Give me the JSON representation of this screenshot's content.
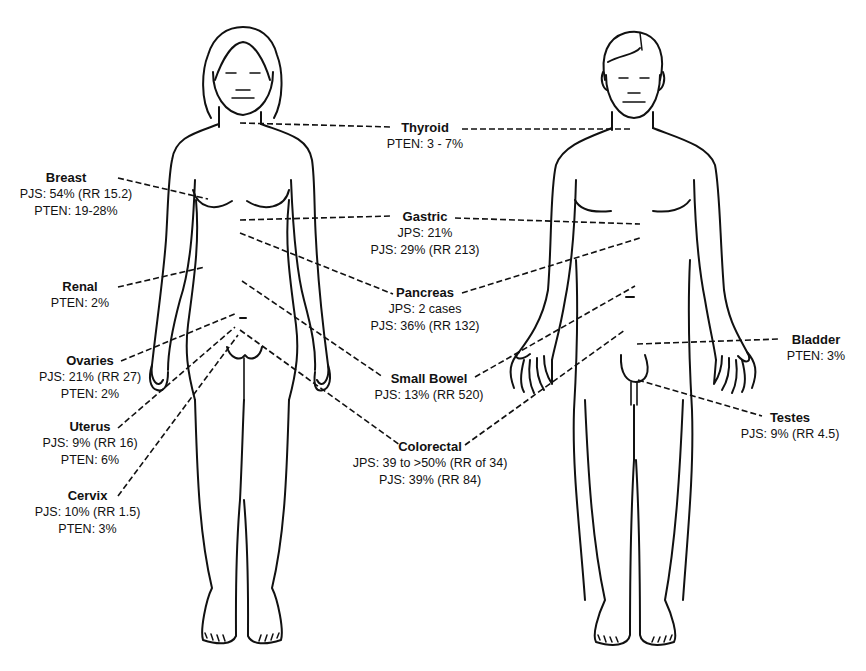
{
  "figure": {
    "type": "anatomical cancer-risk diagram",
    "figures": [
      "female-body",
      "male-body"
    ]
  },
  "organs": [
    {
      "id": "thyroid",
      "name": "Thyroid",
      "stats": [
        "PTEN: 3 - 7%"
      ]
    },
    {
      "id": "breast",
      "name": "Breast",
      "stats": [
        "PJS: 54% (RR 15.2)",
        "PTEN: 19-28%"
      ]
    },
    {
      "id": "gastric",
      "name": "Gastric",
      "stats": [
        "JPS: 21%",
        "PJS: 29% (RR 213)"
      ]
    },
    {
      "id": "renal",
      "name": "Renal",
      "stats": [
        "PTEN: 2%"
      ]
    },
    {
      "id": "pancreas",
      "name": "Pancreas",
      "stats": [
        "JPS: 2 cases",
        "PJS: 36% (RR 132)"
      ]
    },
    {
      "id": "ovaries",
      "name": "Ovaries",
      "stats": [
        "PJS: 21% (RR 27)",
        "PTEN: 2%"
      ]
    },
    {
      "id": "small_bowel",
      "name": "Small Bowel",
      "stats": [
        "PJS: 13% (RR 520)"
      ]
    },
    {
      "id": "bladder",
      "name": "Bladder",
      "stats": [
        "PTEN: 3%"
      ]
    },
    {
      "id": "uterus",
      "name": "Uterus",
      "stats": [
        "PJS: 9% (RR 16)",
        "PTEN: 6%"
      ]
    },
    {
      "id": "testes",
      "name": "Testes",
      "stats": [
        "PJS: 9% (RR 4.5)"
      ]
    },
    {
      "id": "colorectal",
      "name": "Colorectal",
      "stats": [
        "JPS: 39 to >50% (RR of 34)",
        "PJS: 39% (RR 84)"
      ]
    },
    {
      "id": "cervix",
      "name": "Cervix",
      "stats": [
        "PJS: 10% (RR 1.5)",
        "PTEN: 3%"
      ]
    }
  ]
}
